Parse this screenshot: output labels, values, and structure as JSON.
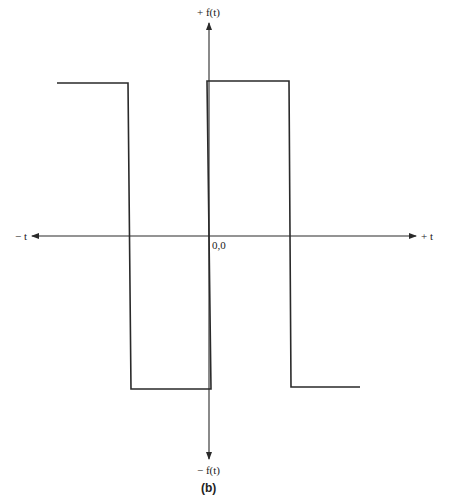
{
  "diagram": {
    "type": "square-wave",
    "caption": "(b)",
    "axes": {
      "y_top_label": "+ f(t)",
      "y_bottom_label": "− f(t)",
      "x_left_label": "− t",
      "x_right_label": "+ t",
      "origin_label": "0,0"
    },
    "waveform": {
      "description": "Square wave alternating between high and low levels, crossing the t-axis",
      "segments": [
        {
          "level": "high",
          "t_start": "left edge",
          "t_end": "first transition (negative t)"
        },
        {
          "level": "low",
          "t_start": "first transition",
          "t_end": "0"
        },
        {
          "level": "high",
          "t_start": "0",
          "t_end": "second transition (positive t)"
        },
        {
          "level": "low",
          "t_start": "second transition",
          "t_end": "right edge"
        }
      ]
    },
    "colors": {
      "line": "#2a2a2a",
      "background": "#ffffff"
    }
  }
}
